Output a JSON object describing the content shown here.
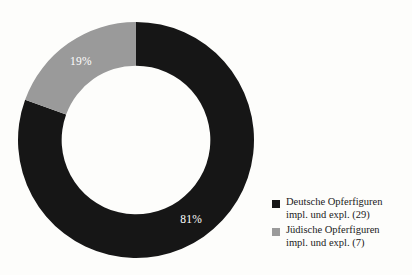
{
  "chart_data": {
    "type": "pie",
    "variant": "donut",
    "title": "",
    "subtitle": "",
    "xlabel": "",
    "ylabel": "",
    "grid": false,
    "legend_position": "right-bottom",
    "start_angle_deg": 0,
    "hole_ratio": 0.63,
    "categories": [
      "Deutsche Opferfiguren impl. und expl.",
      "Jüdische Opferfiguren impl. und expl."
    ],
    "values": [
      29,
      7
    ],
    "total": 36,
    "percent_labels": [
      "81%",
      "19%"
    ],
    "percent_values": [
      81,
      19
    ],
    "colors": [
      "#161616",
      "#9a9a9a"
    ],
    "slices": [
      {
        "label_line1": "Deutsche Opferfiguren",
        "label_line2": "impl. und expl. (29)",
        "count": 29,
        "percent_label": "81%",
        "percent": 81,
        "color": "#161616",
        "direction": "clockwise-from-top"
      },
      {
        "label_line1": "Jüdische Opferfiguren",
        "label_line2": "impl. und expl. (7)",
        "count": 7,
        "percent_label": "19%",
        "percent": 19,
        "color": "#9a9a9a",
        "direction": "counterclockwise-from-top"
      }
    ]
  },
  "donut": {
    "label_black": "81%",
    "label_gray": "19%"
  },
  "legend": {
    "items": [
      {
        "swatch_color": "#161616",
        "line1": "Deutsche Opferfiguren",
        "line2": "impl. und expl. (29)"
      },
      {
        "swatch_color": "#9a9a9a",
        "line1": "Jüdische Opferfiguren",
        "line2": "impl. und expl. (7)"
      }
    ]
  }
}
